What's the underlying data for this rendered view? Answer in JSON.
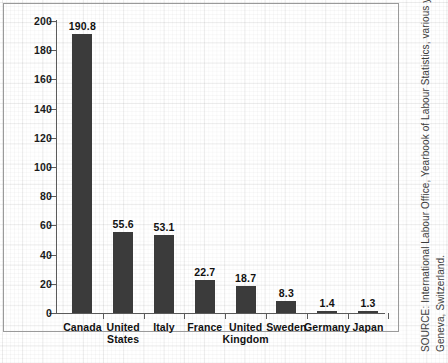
{
  "chart_data": {
    "type": "bar",
    "title": "",
    "xlabel": "",
    "ylabel": "Days Lost to Strikes per Thousand Workers per Year (5-year average)",
    "ylim": [
      0,
      200
    ],
    "yticks": [
      0,
      20,
      40,
      60,
      80,
      100,
      120,
      140,
      160,
      180,
      200
    ],
    "ytick_labels": [
      "0",
      "20",
      "40",
      "60",
      "80",
      "100",
      "120",
      "140",
      "160",
      "180",
      "200"
    ],
    "grid": true,
    "legend": "none",
    "categories": [
      "Canada",
      "United\nStates",
      "Italy",
      "France",
      "United\nKingdom",
      "Sweden",
      "Germany",
      "Japan"
    ],
    "values": [
      190.8,
      55.6,
      53.1,
      22.7,
      18.7,
      8.3,
      1.4,
      1.3
    ],
    "value_labels": [
      "190.8",
      "55.6",
      "53.1",
      "22.7",
      "18.7",
      "8.3",
      "1.4",
      "1.3"
    ],
    "bar_color": "#3b3b3b",
    "axis_color": "#5a5a5a"
  },
  "source": {
    "lines": [
      "SOURCE: International Labour Office, Yearbook of Labour Statistics, various years,",
      "Geneva, Switzerland."
    ]
  }
}
